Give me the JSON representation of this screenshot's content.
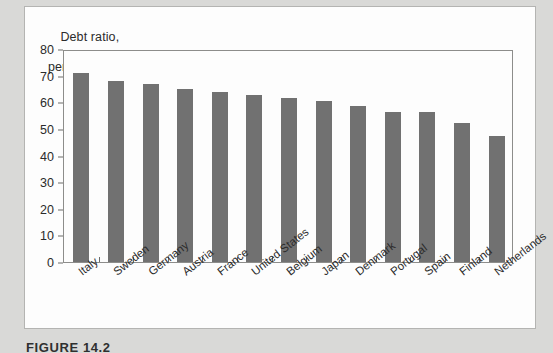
{
  "figure": {
    "caption": "FIGURE 14.2",
    "axis_title_line1": "Debt ratio,",
    "axis_title_line2": "percent"
  },
  "colors": {
    "bar": "#717171",
    "page_background": "#d9d9d7",
    "card_background": "#fdfdfd",
    "frame": "#8d8d8b",
    "text": "#2b2b2b"
  },
  "chart_data": {
    "type": "bar",
    "title": "Debt ratio, percent",
    "xlabel": "",
    "ylabel": "Debt ratio, percent",
    "ylim": [
      0,
      80
    ],
    "yticks": [
      0,
      10,
      20,
      30,
      40,
      50,
      60,
      70,
      80
    ],
    "ytick_labels": [
      "0",
      "10",
      "20",
      "30",
      "40",
      "50",
      "60",
      "70",
      "80"
    ],
    "grid": false,
    "legend": null,
    "orientation": "vertical",
    "categories": [
      "Italy",
      "Sweden",
      "Germany",
      "Austria",
      "France",
      "United States",
      "Belgium",
      "Japan",
      "Denmark",
      "Portugal",
      "Spain",
      "Finland",
      "Netherlands"
    ],
    "values": [
      71.0,
      68.0,
      67.0,
      65.0,
      64.0,
      62.6,
      61.6,
      60.5,
      58.6,
      56.5,
      56.3,
      52.3,
      47.3
    ],
    "series": [
      {
        "name": "Debt ratio",
        "values": [
          71.0,
          68.0,
          67.0,
          65.0,
          64.0,
          62.6,
          61.6,
          60.5,
          58.6,
          56.5,
          56.3,
          52.3,
          47.3
        ]
      }
    ]
  }
}
